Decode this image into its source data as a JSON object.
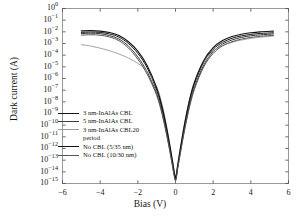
{
  "chart_data": {
    "type": "line",
    "title": "",
    "xlabel": "Bias (V)",
    "ylabel": "Dark current (A)",
    "xlim": [
      -6,
      6
    ],
    "ylim_exponent": [
      -15,
      0
    ],
    "yscale": "log",
    "grid": false,
    "legend_position": "lower-left-inside",
    "xticks": [
      "−6",
      "−4",
      "−2",
      "0",
      "2",
      "4",
      "6"
    ],
    "xtick_values": [
      -6,
      -4,
      -2,
      0,
      2,
      4,
      6
    ],
    "ytick_exponents": [
      0,
      -1,
      -2,
      -3,
      -4,
      -5,
      -6,
      -7,
      -8,
      -9,
      -10,
      -11,
      -12,
      -13,
      -14,
      -15
    ],
    "series": [
      {
        "name": "3 nm-InAlAs CBL",
        "color": "#161616",
        "width": 1.0,
        "points": [
          [
            -5.0,
            -2.05
          ],
          [
            -4.5,
            -2.02
          ],
          [
            -4.0,
            -2.05
          ],
          [
            -3.5,
            -2.18
          ],
          [
            -3.0,
            -2.45
          ],
          [
            -2.5,
            -3.0
          ],
          [
            -2.0,
            -3.85
          ],
          [
            -1.5,
            -5.1
          ],
          [
            -1.0,
            -7.0
          ],
          [
            -0.7,
            -8.7
          ],
          [
            -0.45,
            -10.6
          ],
          [
            -0.25,
            -12.4
          ],
          [
            -0.12,
            -13.6
          ],
          [
            -0.05,
            -14.3
          ],
          [
            0.0,
            -14.6
          ],
          [
            0.05,
            -14.3
          ],
          [
            0.12,
            -13.5
          ],
          [
            0.25,
            -12.2
          ],
          [
            0.45,
            -10.3
          ],
          [
            0.7,
            -8.3
          ],
          [
            1.0,
            -6.5
          ],
          [
            1.5,
            -4.6
          ],
          [
            2.0,
            -3.5
          ],
          [
            2.5,
            -2.9
          ],
          [
            3.0,
            -2.55
          ],
          [
            3.5,
            -2.35
          ],
          [
            4.0,
            -2.22
          ],
          [
            4.5,
            -2.14
          ],
          [
            5.2,
            -2.08
          ]
        ]
      },
      {
        "name": "5 nm-InAlAs CBL",
        "color": "#3a3a3a",
        "width": 1.0,
        "points": [
          [
            -5.0,
            -2.15
          ],
          [
            -4.5,
            -2.12
          ],
          [
            -4.0,
            -2.16
          ],
          [
            -3.5,
            -2.32
          ],
          [
            -3.0,
            -2.62
          ],
          [
            -2.5,
            -3.22
          ],
          [
            -2.0,
            -4.15
          ],
          [
            -1.5,
            -5.45
          ],
          [
            -1.0,
            -7.3
          ],
          [
            -0.7,
            -9.0
          ],
          [
            -0.45,
            -10.9
          ],
          [
            -0.25,
            -12.6
          ],
          [
            -0.12,
            -13.8
          ],
          [
            -0.05,
            -14.4
          ],
          [
            0.0,
            -14.7
          ],
          [
            0.05,
            -14.4
          ],
          [
            0.12,
            -13.6
          ],
          [
            0.25,
            -12.4
          ],
          [
            0.45,
            -10.6
          ],
          [
            0.7,
            -8.6
          ],
          [
            1.0,
            -6.8
          ],
          [
            1.5,
            -4.85
          ],
          [
            2.0,
            -3.7
          ],
          [
            2.5,
            -3.05
          ],
          [
            3.0,
            -2.7
          ],
          [
            3.5,
            -2.48
          ],
          [
            4.0,
            -2.34
          ],
          [
            4.5,
            -2.26
          ],
          [
            5.2,
            -2.18
          ]
        ]
      },
      {
        "name": "3 nm-InAlAs CBL20 period",
        "color": "#9a9a9a",
        "width": 0.9,
        "points": [
          [
            -5.0,
            -3.1
          ],
          [
            -4.5,
            -3.22
          ],
          [
            -4.0,
            -3.4
          ],
          [
            -3.5,
            -3.62
          ],
          [
            -3.0,
            -3.9
          ],
          [
            -2.5,
            -4.25
          ],
          [
            -2.0,
            -4.7
          ],
          [
            -1.5,
            -5.4
          ],
          [
            -1.0,
            -6.7
          ],
          [
            -0.7,
            -8.3
          ],
          [
            -0.45,
            -10.3
          ],
          [
            -0.25,
            -12.2
          ],
          [
            -0.12,
            -13.4
          ],
          [
            -0.05,
            -14.1
          ],
          [
            0.0,
            -14.45
          ],
          [
            0.05,
            -14.1
          ],
          [
            0.12,
            -13.3
          ],
          [
            0.25,
            -12.0
          ],
          [
            0.45,
            -10.1
          ],
          [
            0.7,
            -8.1
          ],
          [
            1.0,
            -6.3
          ],
          [
            1.5,
            -4.55
          ],
          [
            2.0,
            -3.65
          ],
          [
            2.5,
            -3.18
          ],
          [
            3.0,
            -2.9
          ],
          [
            3.5,
            -2.7
          ],
          [
            4.0,
            -2.56
          ],
          [
            4.5,
            -2.46
          ],
          [
            5.2,
            -2.36
          ]
        ]
      },
      {
        "name": "No CBL (5/35 nm)",
        "color": "#111111",
        "width": 1.1,
        "points": [
          [
            -5.0,
            -1.92
          ],
          [
            -4.5,
            -1.9
          ],
          [
            -4.0,
            -1.94
          ],
          [
            -3.5,
            -2.06
          ],
          [
            -3.0,
            -2.32
          ],
          [
            -2.5,
            -2.85
          ],
          [
            -2.0,
            -3.65
          ],
          [
            -1.5,
            -4.9
          ],
          [
            -1.0,
            -6.8
          ],
          [
            -0.7,
            -8.5
          ],
          [
            -0.45,
            -10.4
          ],
          [
            -0.25,
            -12.2
          ],
          [
            -0.12,
            -13.5
          ],
          [
            -0.05,
            -14.2
          ],
          [
            0.0,
            -14.55
          ],
          [
            0.05,
            -14.2
          ],
          [
            0.12,
            -13.4
          ],
          [
            0.25,
            -12.1
          ],
          [
            0.45,
            -10.2
          ],
          [
            0.7,
            -8.15
          ],
          [
            1.0,
            -6.35
          ],
          [
            1.5,
            -4.45
          ],
          [
            2.0,
            -3.35
          ],
          [
            2.5,
            -2.75
          ],
          [
            3.0,
            -2.4
          ],
          [
            3.5,
            -2.2
          ],
          [
            4.0,
            -2.08
          ],
          [
            4.5,
            -2.0
          ],
          [
            5.2,
            -1.94
          ]
        ]
      },
      {
        "name": "No CBL (10/30 nm)",
        "color": "#565656",
        "width": 1.0,
        "points": [
          [
            -5.0,
            -2.28
          ],
          [
            -4.5,
            -2.25
          ],
          [
            -4.0,
            -2.29
          ],
          [
            -3.5,
            -2.44
          ],
          [
            -3.0,
            -2.76
          ],
          [
            -2.5,
            -3.38
          ],
          [
            -2.0,
            -4.35
          ],
          [
            -1.5,
            -5.65
          ],
          [
            -1.0,
            -7.45
          ],
          [
            -0.7,
            -9.15
          ],
          [
            -0.45,
            -11.0
          ],
          [
            -0.25,
            -12.7
          ],
          [
            -0.12,
            -13.9
          ],
          [
            -0.05,
            -14.5
          ],
          [
            0.0,
            -14.78
          ],
          [
            0.05,
            -14.5
          ],
          [
            0.12,
            -13.7
          ],
          [
            0.25,
            -12.5
          ],
          [
            0.45,
            -10.7
          ],
          [
            0.7,
            -8.75
          ],
          [
            1.0,
            -6.95
          ],
          [
            1.5,
            -5.0
          ],
          [
            2.0,
            -3.85
          ],
          [
            2.5,
            -3.2
          ],
          [
            3.0,
            -2.85
          ],
          [
            3.5,
            -2.62
          ],
          [
            4.0,
            -2.48
          ],
          [
            4.5,
            -2.38
          ],
          [
            5.2,
            -2.3
          ]
        ]
      }
    ]
  },
  "legend": {
    "entries": [
      {
        "label": "3 nm-InAlAs CBL",
        "color": "#161616",
        "width": 1.3
      },
      {
        "label": "5 nm-InAlAs CBL",
        "color": "#3a3a3a",
        "width": 1.2
      },
      {
        "label": "3 nm-InAlAs CBL20",
        "color": "#9a9a9a",
        "width": 1.0
      },
      {
        "label": "No CBL (5/35 nm)",
        "color": "#111111",
        "width": 1.5
      },
      {
        "label": "No CBL (10/30 nm)",
        "color": "#565656",
        "width": 1.2
      }
    ],
    "continuation_label": "period"
  }
}
